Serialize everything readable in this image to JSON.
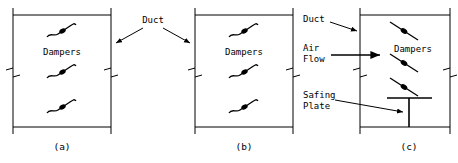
{
  "figure": {
    "type": "engineering-diagram",
    "stroke_color": "#000000",
    "background_color": "#ffffff"
  },
  "panels": [
    {
      "id": "a",
      "caption": "(a)",
      "damper_style": "curled-s-blade",
      "damper_count": 3,
      "labels": [
        {
          "name": "dampers-label",
          "text": "Dampers"
        }
      ]
    },
    {
      "id": "b",
      "caption": "(b)",
      "damper_style": "curled-s-blade",
      "damper_count": 3,
      "labels": [
        {
          "name": "dampers-label",
          "text": "Dampers"
        }
      ]
    },
    {
      "id": "c",
      "caption": "(c)",
      "damper_style": "straight-blade",
      "damper_count": 3,
      "labels": [
        {
          "name": "duct-label",
          "text": "Duct"
        },
        {
          "name": "air-flow-label-line1",
          "text": "Air"
        },
        {
          "name": "air-flow-label-line2",
          "text": "Flow"
        },
        {
          "name": "dampers-label",
          "text": "Dampers"
        },
        {
          "name": "safing-plate-label-line1",
          "text": "Safing"
        },
        {
          "name": "safing-plate-label-line2",
          "text": "Plate"
        }
      ]
    }
  ],
  "center_annotation": {
    "name": "duct-callout",
    "text": "Duct",
    "arrow_count": 2,
    "points_to": [
      "panel-a-right-wall",
      "panel-b-left-wall"
    ]
  },
  "captions": {
    "a": "(a)",
    "b": "(b)",
    "c": "(c)"
  },
  "common_labels": {
    "dampers": "Dampers",
    "duct": "Duct",
    "air": "Air",
    "flow": "Flow",
    "safing": "Safing",
    "plate": "Plate"
  }
}
